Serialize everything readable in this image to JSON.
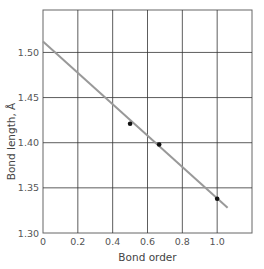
{
  "chart_data": {
    "type": "scatter",
    "title": "",
    "xlabel": "Bond order",
    "ylabel": "Bond length, Å",
    "xlim": [
      0,
      1.2
    ],
    "ylim": [
      1.3,
      1.547
    ],
    "grid": true,
    "x_ticks": [
      "0",
      "0.2",
      "0.4",
      "0.6",
      "0.8",
      "1.0"
    ],
    "y_ticks": [
      "1.30",
      "1.35",
      "1.40",
      "1.45",
      "1.50"
    ],
    "series": [
      {
        "name": "data points",
        "type": "scatter",
        "x": [
          0.5,
          0.667,
          1.0
        ],
        "y": [
          1.421,
          1.398,
          1.338
        ]
      },
      {
        "name": "fit line",
        "type": "line",
        "x": [
          0.0,
          1.06
        ],
        "y": [
          1.512,
          1.328
        ]
      }
    ],
    "colors": {
      "line": "#999999",
      "points": "#111111",
      "grid": "#333333"
    }
  }
}
